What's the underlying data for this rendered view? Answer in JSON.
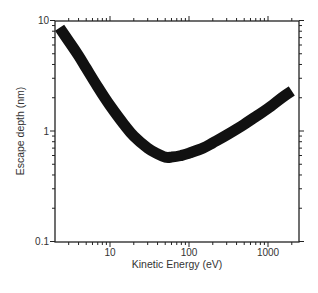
{
  "chart_data": {
    "type": "line",
    "title": "",
    "xlabel": "Kinetic Energy (eV)",
    "ylabel": "Escape depth (nm)",
    "xscale": "log",
    "yscale": "log",
    "xlim": [
      2,
      2500
    ],
    "ylim": [
      0.1,
      10
    ],
    "grid": false,
    "legend": null,
    "x_ticks": [
      "10",
      "100",
      "1000"
    ],
    "y_ticks": [
      "0.1",
      "1",
      "10"
    ],
    "series": [
      {
        "name": "Universal curve",
        "color": "#111111",
        "x": [
          2.3,
          3,
          4,
          5,
          7,
          10,
          15,
          20,
          30,
          40,
          50,
          60,
          80,
          100,
          150,
          200,
          300,
          500,
          700,
          1000,
          1500,
          2000
        ],
        "y": [
          8.6,
          6.5,
          4.8,
          3.7,
          2.5,
          1.7,
          1.15,
          0.9,
          0.7,
          0.62,
          0.58,
          0.58,
          0.6,
          0.63,
          0.7,
          0.78,
          0.92,
          1.15,
          1.35,
          1.6,
          2.0,
          2.3
        ]
      }
    ]
  }
}
